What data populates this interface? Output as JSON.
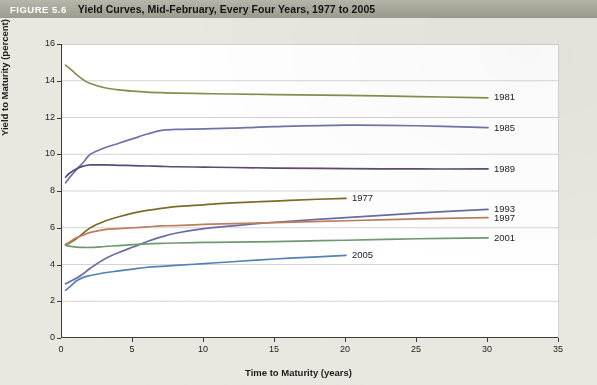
{
  "caption": {
    "figure_tag": "FIGURE 5.6",
    "title": "Yield Curves, Mid-February, Every Four Years, 1977 to 2005"
  },
  "chart_data": {
    "type": "line",
    "title": "Yield Curves, Mid-February, Every Four Years, 1977 to 2005",
    "xlabel": "Time to Maturity (years)",
    "ylabel": "Yield to Maturity (percent)",
    "xlim": [
      0,
      35
    ],
    "ylim": [
      0,
      16
    ],
    "xticks": [
      0,
      5,
      10,
      15,
      20,
      25,
      30,
      35
    ],
    "yticks": [
      0,
      2,
      4,
      6,
      8,
      10,
      12,
      14,
      16
    ],
    "grid": "horizontal",
    "legend_position": "right-of-line-ends",
    "series": [
      {
        "name": "1981",
        "color": "#8a8c4d",
        "label_x": 30,
        "label_y": 13.1,
        "x": [
          0.25,
          0.5,
          1,
          1.5,
          2,
          3,
          4,
          5,
          6,
          7,
          8,
          10,
          12,
          15,
          20,
          25,
          30
        ],
        "y": [
          14.85,
          14.7,
          14.35,
          14.05,
          13.85,
          13.62,
          13.5,
          13.43,
          13.38,
          13.35,
          13.33,
          13.3,
          13.28,
          13.25,
          13.2,
          13.14,
          13.07
        ]
      },
      {
        "name": "1985",
        "color": "#6f74a8",
        "label_x": 30,
        "label_y": 11.45,
        "x": [
          0.25,
          0.5,
          1,
          1.5,
          2,
          3,
          4,
          5,
          6,
          7,
          8,
          10,
          12,
          15,
          20,
          25,
          30
        ],
        "y": [
          8.45,
          8.7,
          9.15,
          9.55,
          10.0,
          10.35,
          10.6,
          10.85,
          11.1,
          11.3,
          11.35,
          11.38,
          11.42,
          11.5,
          11.58,
          11.55,
          11.45
        ]
      },
      {
        "name": "1989",
        "color": "#5e4a6e",
        "label_x": 30,
        "label_y": 9.2,
        "x": [
          0.25,
          0.5,
          1,
          1.5,
          2,
          3,
          4,
          5,
          6,
          7,
          8,
          10,
          12,
          15,
          20,
          25,
          30
        ],
        "y": [
          8.75,
          8.95,
          9.2,
          9.35,
          9.42,
          9.42,
          9.4,
          9.38,
          9.36,
          9.34,
          9.32,
          9.3,
          9.28,
          9.25,
          9.22,
          9.2,
          9.2
        ]
      },
      {
        "name": "1977",
        "color": "#7d6b2a",
        "label_x": 20,
        "label_y": 7.6,
        "x": [
          0.25,
          0.5,
          1,
          1.5,
          2,
          3,
          4,
          5,
          6,
          7,
          8,
          10,
          12,
          15,
          18,
          20
        ],
        "y": [
          5.05,
          5.15,
          5.4,
          5.7,
          6.0,
          6.35,
          6.6,
          6.8,
          6.95,
          7.05,
          7.15,
          7.25,
          7.35,
          7.45,
          7.55,
          7.6
        ]
      },
      {
        "name": "1993",
        "color": "#6a6ba0",
        "label_x": 30,
        "label_y": 7.0,
        "x": [
          0.25,
          0.5,
          1,
          1.5,
          2,
          3,
          4,
          5,
          6,
          7,
          8,
          10,
          12,
          15,
          20,
          25,
          30
        ],
        "y": [
          2.95,
          3.05,
          3.25,
          3.5,
          3.8,
          4.3,
          4.65,
          4.95,
          5.25,
          5.5,
          5.7,
          5.95,
          6.1,
          6.3,
          6.55,
          6.8,
          7.0
        ]
      },
      {
        "name": "1997",
        "color": "#bd7d5e",
        "label_x": 30,
        "label_y": 6.55,
        "x": [
          0.25,
          0.5,
          1,
          1.5,
          2,
          3,
          4,
          5,
          6,
          7,
          8,
          10,
          12,
          15,
          20,
          25,
          30
        ],
        "y": [
          5.1,
          5.2,
          5.45,
          5.6,
          5.75,
          5.9,
          5.95,
          6.0,
          6.05,
          6.1,
          6.12,
          6.18,
          6.22,
          6.28,
          6.38,
          6.48,
          6.55
        ]
      },
      {
        "name": "2001",
        "color": "#6f9a6e",
        "label_x": 30,
        "label_y": 5.45,
        "x": [
          0.25,
          0.5,
          1,
          1.5,
          2,
          3,
          4,
          5,
          6,
          7,
          8,
          10,
          12,
          15,
          20,
          25,
          30
        ],
        "y": [
          5.05,
          5.0,
          4.95,
          4.93,
          4.93,
          4.98,
          5.03,
          5.08,
          5.12,
          5.15,
          5.17,
          5.2,
          5.22,
          5.25,
          5.32,
          5.4,
          5.45
        ]
      },
      {
        "name": "2005",
        "color": "#5383b5",
        "label_x": 20,
        "label_y": 4.5,
        "x": [
          0.25,
          0.5,
          1,
          1.5,
          2,
          3,
          4,
          5,
          6,
          7,
          8,
          10,
          12,
          15,
          18,
          20
        ],
        "y": [
          2.6,
          2.75,
          3.1,
          3.3,
          3.4,
          3.55,
          3.65,
          3.75,
          3.85,
          3.9,
          3.95,
          4.05,
          4.15,
          4.3,
          4.42,
          4.5
        ]
      }
    ]
  }
}
